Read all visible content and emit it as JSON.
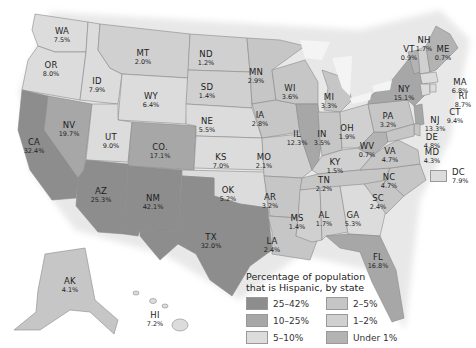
{
  "legend": {
    "title_line1": "Percentage of population",
    "title_line2": "that is Hispanic, by state",
    "items": [
      {
        "label": "25–42%",
        "color": "#8d8d8d"
      },
      {
        "label": "2–5%",
        "color": "#c6c6c6"
      },
      {
        "label": "10–25%",
        "color": "#a7a7a7"
      },
      {
        "label": "1–2%",
        "color": "#d0d0d0"
      },
      {
        "label": "5–10%",
        "color": "#dcdcdc"
      },
      {
        "label": "Under 1%",
        "color": "#b3b3b3"
      }
    ]
  },
  "states": {
    "WA": {
      "abbr": "WA",
      "pct": "7.5%"
    },
    "OR": {
      "abbr": "OR",
      "pct": "8.0%"
    },
    "CA": {
      "abbr": "CA",
      "pct": "32.4%"
    },
    "NV": {
      "abbr": "NV",
      "pct": "19.7%"
    },
    "ID": {
      "abbr": "ID",
      "pct": "7.9%"
    },
    "MT": {
      "abbr": "MT",
      "pct": "2.0%"
    },
    "WY": {
      "abbr": "WY",
      "pct": "6.4%"
    },
    "UT": {
      "abbr": "UT",
      "pct": "9.0%"
    },
    "CO": {
      "abbr": "CO.",
      "pct": "17.1%"
    },
    "AZ": {
      "abbr": "AZ",
      "pct": "25.3%"
    },
    "NM": {
      "abbr": "NM",
      "pct": "42.1%"
    },
    "ND": {
      "abbr": "ND",
      "pct": "1.2%"
    },
    "SD": {
      "abbr": "SD",
      "pct": "1.4%"
    },
    "NE": {
      "abbr": "NE",
      "pct": "5.5%"
    },
    "KS": {
      "abbr": "KS",
      "pct": "7.0%"
    },
    "OK": {
      "abbr": "OK",
      "pct": "5.2%"
    },
    "TX": {
      "abbr": "TX",
      "pct": "32.0%"
    },
    "MN": {
      "abbr": "MN",
      "pct": "2.9%"
    },
    "IA": {
      "abbr": "IA",
      "pct": "2.8%"
    },
    "MO": {
      "abbr": "MO",
      "pct": "2.1%"
    },
    "AR": {
      "abbr": "AR",
      "pct": "3.2%"
    },
    "LA": {
      "abbr": "LA",
      "pct": "2.4%"
    },
    "WI": {
      "abbr": "WI",
      "pct": "3.6%"
    },
    "IL": {
      "abbr": "IL",
      "pct": "12.3%"
    },
    "MI": {
      "abbr": "MI",
      "pct": "3.3%"
    },
    "IN": {
      "abbr": "IN",
      "pct": "3.5%"
    },
    "OH": {
      "abbr": "OH",
      "pct": "1.9%"
    },
    "KY": {
      "abbr": "KY",
      "pct": "1.5%"
    },
    "TN": {
      "abbr": "TN",
      "pct": "2.2%"
    },
    "MS": {
      "abbr": "MS",
      "pct": "1.4%"
    },
    "AL": {
      "abbr": "AL",
      "pct": "1.7%"
    },
    "GA": {
      "abbr": "GA",
      "pct": "5.3%"
    },
    "FL": {
      "abbr": "FL",
      "pct": "16.8%"
    },
    "SC": {
      "abbr": "SC",
      "pct": "2.4%"
    },
    "NC": {
      "abbr": "NC",
      "pct": "4.7%"
    },
    "VA": {
      "abbr": "VA",
      "pct": "4.7%"
    },
    "WV": {
      "abbr": "WV",
      "pct": "0.7%"
    },
    "PA": {
      "abbr": "PA",
      "pct": "3.2%"
    },
    "NY": {
      "abbr": "NY",
      "pct": "15.1%"
    },
    "VT": {
      "abbr": "VT",
      "pct": "0.9%"
    },
    "NH": {
      "abbr": "NH",
      "pct": "1.7%"
    },
    "ME": {
      "abbr": "ME",
      "pct": "0.7%"
    },
    "MA": {
      "abbr": "MA",
      "pct": "6.8%"
    },
    "RI": {
      "abbr": "RI",
      "pct": "8.7%"
    },
    "CT": {
      "abbr": "CT",
      "pct": "9.4%"
    },
    "NJ": {
      "abbr": "NJ",
      "pct": "13.3%"
    },
    "DE": {
      "abbr": "DE",
      "pct": "4.8%"
    },
    "MD": {
      "abbr": "MD",
      "pct": "4.3%"
    },
    "DC": {
      "abbr": "DC",
      "pct": "7.9%"
    },
    "AK": {
      "abbr": "AK",
      "pct": "4.1%"
    },
    "HI": {
      "abbr": "HI",
      "pct": "7.2%"
    }
  }
}
